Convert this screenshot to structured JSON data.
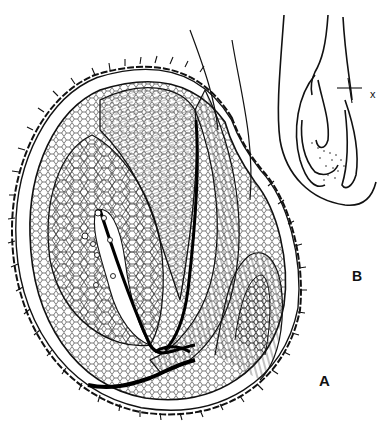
{
  "figure": {
    "panels": [
      {
        "id": "A",
        "label": "A",
        "content": "detailed cellular section with spiny outer integument, embryo sac, funiculus and vascular strand"
      },
      {
        "id": "B",
        "label": "B",
        "content": "outline diagram of ovule with plane marker"
      }
    ],
    "markers": {
      "plane_label": "x"
    },
    "colors": {
      "ink": "#111111",
      "paper": "#ffffff"
    }
  }
}
